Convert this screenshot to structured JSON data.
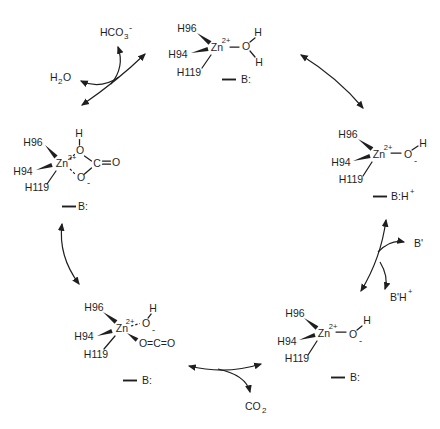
{
  "figure": {
    "background": "#ffffff",
    "ink": "#1f1f1f"
  },
  "complexes": {
    "top_water": {
      "ligand1": "H96",
      "ligand2": "H94",
      "ligand3": "H119",
      "metal": "Zn",
      "charge": "2+",
      "oxygen": "O",
      "h_upper": "H",
      "h_lower": "H",
      "base": "B:"
    },
    "right_hydroxide": {
      "ligand1": "H96",
      "ligand2": "H94",
      "ligand3": "H119",
      "metal": "Zn",
      "charge": "2+",
      "oxygen": "O",
      "minus": "-",
      "hydrogen": "H",
      "base": "B:H",
      "base_sup": "+"
    },
    "bottom_right_hydroxide": {
      "ligand1": "H96",
      "ligand2": "H94",
      "ligand3": "H119",
      "metal": "Zn",
      "charge": "2+",
      "oxygen": "O",
      "minus": "-",
      "hydrogen": "H",
      "base": "B:"
    },
    "bottom_co2_adduct": {
      "ligand1": "H96",
      "ligand2": "H94",
      "ligand3": "H119",
      "metal": "Zn",
      "charge": "2+",
      "oxygen": "O",
      "minus": "-",
      "hydrogen": "H",
      "co2": "O=C=O",
      "base": "B:"
    },
    "left_bicarbonate": {
      "ligand1": "H96",
      "ligand2": "H94",
      "ligand3": "H119",
      "metal": "Zn",
      "charge": "2+",
      "o_top": "O",
      "h_top": "H",
      "carbon": "C",
      "o_double": "O",
      "o_bottom": "O",
      "minus": "-",
      "base": "B:"
    }
  },
  "species": {
    "bicarbonate": {
      "main": "HCO",
      "sub": "3",
      "sup": "-"
    },
    "water": {
      "h": "H",
      "sub": "2",
      "o": "O"
    },
    "co2": {
      "main": "CO",
      "sub": "2"
    },
    "buffer_base": "B'",
    "buffer_acid": {
      "main": "B'H",
      "sup": "+"
    }
  }
}
